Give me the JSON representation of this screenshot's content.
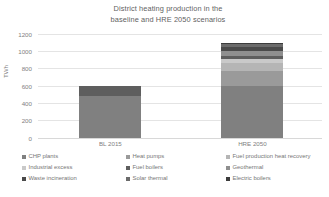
{
  "chart_data": {
    "type": "bar",
    "subtype": "stacked-column",
    "title": "District heating production in the baseline and HRE 2050 scenarios",
    "title_lines": [
      "District heating production in the",
      "baseline and HRE 2050 scenarios"
    ],
    "xlabel": "",
    "ylabel": "TWh",
    "ylim": [
      0,
      1200
    ],
    "yticks": [
      0,
      200,
      400,
      600,
      800,
      1000,
      1200
    ],
    "ytick_labels": [
      "0",
      "200",
      "400",
      "600",
      "800",
      "1000",
      "1200"
    ],
    "grid": true,
    "grid_axis": "y",
    "legend_position": "bottom",
    "legend_columns": 3,
    "categories": [
      "BL 2015",
      "HRE 2050"
    ],
    "series": [
      {
        "name": "CHP plants",
        "color": "#808080",
        "values": [
          480,
          600
        ]
      },
      {
        "name": "Heat pumps",
        "color": "#9a9a9a",
        "values": [
          0,
          170
        ]
      },
      {
        "name": "Fuel production heat recovery",
        "color": "#b5b5b5",
        "values": [
          0,
          95
        ]
      },
      {
        "name": "Industrial excess",
        "color": "#c9c9c9",
        "values": [
          0,
          40
        ]
      },
      {
        "name": "Fuel boilers",
        "color": "#5e5e5e",
        "values": [
          120,
          35
        ]
      },
      {
        "name": "Geothermal",
        "color": "#8f8f8f",
        "values": [
          0,
          55
        ]
      },
      {
        "name": "Waste incineration",
        "color": "#4a4a4a",
        "values": [
          0,
          50
        ]
      },
      {
        "name": "Solar thermal",
        "color": "#6b6b6b",
        "values": [
          0,
          30
        ]
      },
      {
        "name": "Electric boilers",
        "color": "#3c3c3c",
        "values": [
          0,
          15
        ]
      }
    ],
    "totals": [
      600,
      1090
    ]
  },
  "legend": {
    "items": [
      {
        "label": "CHP plants"
      },
      {
        "label": "Heat pumps"
      },
      {
        "label": "Fuel production heat recovery"
      },
      {
        "label": "Industrial excess"
      },
      {
        "label": "Fuel boilers"
      },
      {
        "label": "Geothermal"
      },
      {
        "label": "Waste incineration"
      },
      {
        "label": "Solar thermal"
      },
      {
        "label": "Electric boilers"
      }
    ]
  }
}
